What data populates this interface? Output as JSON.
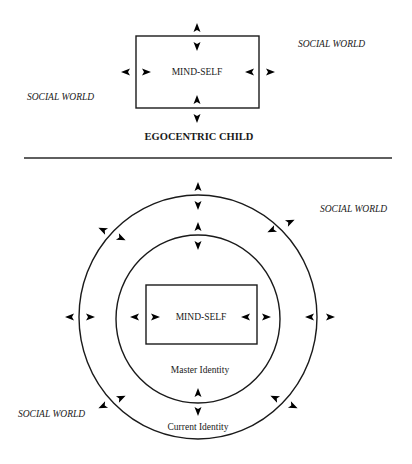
{
  "top_diagram": {
    "box_label": "MIND-SELF",
    "caption": "EGOCENTRIC CHILD",
    "social_world_labels": [
      "SOCIAL WORLD",
      "SOCIAL WORLD"
    ]
  },
  "bottom_diagram": {
    "box_label": "MIND-SELF",
    "inner_ring_label": "Master Identity",
    "outer_ring_label": "Current Identity",
    "social_world_labels": [
      "SOCIAL WORLD",
      "SOCIAL WORLD"
    ]
  },
  "colors": {
    "ink": "#1a1a1a",
    "background": "#ffffff"
  }
}
